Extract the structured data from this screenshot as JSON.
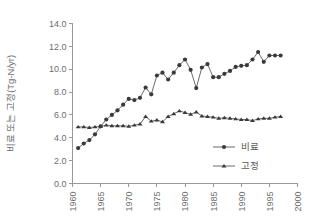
{
  "chart_data": {
    "type": "line",
    "title": "",
    "subtitle": "",
    "xlabel": "",
    "ylabel": "비료 또는 고정(Tg-N/yr)",
    "xlim": [
      1960,
      2000
    ],
    "ylim": [
      0.0,
      14.0
    ],
    "xticks": [
      1960,
      1965,
      1970,
      1975,
      1980,
      1985,
      1990,
      1995,
      2000
    ],
    "xtick_labels": [
      "1960",
      "1965",
      "1970",
      "1975",
      "1980",
      "1985",
      "1990",
      "1995",
      "2000"
    ],
    "yticks": [
      0.0,
      2.0,
      4.0,
      6.0,
      8.0,
      10.0,
      12.0,
      14.0
    ],
    "ytick_labels": [
      "0.0",
      "2.0",
      "4.0",
      "6.0",
      "8.0",
      "10.0",
      "12.0",
      "14.0"
    ],
    "grid": false,
    "legend_position": "inside-lower-right",
    "x": [
      1961,
      1962,
      1963,
      1964,
      1965,
      1966,
      1967,
      1968,
      1969,
      1970,
      1971,
      1972,
      1973,
      1974,
      1975,
      1976,
      1977,
      1978,
      1979,
      1980,
      1981,
      1982,
      1983,
      1984,
      1985,
      1986,
      1987,
      1988,
      1989,
      1990,
      1991,
      1992,
      1993,
      1994,
      1995,
      1996,
      1997
    ],
    "series": [
      {
        "name": "비료",
        "marker": "circle",
        "values": [
          3.1,
          3.5,
          3.8,
          4.3,
          5.0,
          5.6,
          6.0,
          6.4,
          6.9,
          7.4,
          7.3,
          7.5,
          8.4,
          7.8,
          9.45,
          9.7,
          9.1,
          9.7,
          10.35,
          10.85,
          9.95,
          8.35,
          10.15,
          10.45,
          9.3,
          9.3,
          9.6,
          9.85,
          10.2,
          10.3,
          10.35,
          10.85,
          11.5,
          10.65,
          11.2,
          11.2,
          11.2
        ]
      },
      {
        "name": "고정",
        "marker": "triangle",
        "values": [
          4.95,
          4.95,
          4.9,
          4.95,
          5.0,
          5.1,
          5.05,
          5.05,
          5.05,
          5.0,
          5.1,
          5.2,
          5.85,
          5.45,
          5.55,
          5.4,
          5.85,
          6.1,
          6.35,
          6.2,
          6.05,
          6.25,
          5.9,
          5.85,
          5.8,
          5.7,
          5.75,
          5.7,
          5.65,
          5.6,
          5.6,
          5.5,
          5.65,
          5.7,
          5.7,
          5.8,
          5.85
        ]
      }
    ],
    "legend": [
      {
        "label": "비료",
        "marker": "circle"
      },
      {
        "label": "고정",
        "marker": "triangle"
      }
    ],
    "colors": {
      "marker": "#3a3a3a",
      "line": "#5a5a5a",
      "axis": "#999999",
      "tick_text": "#6d6d6d",
      "background": "#ffffff"
    }
  }
}
